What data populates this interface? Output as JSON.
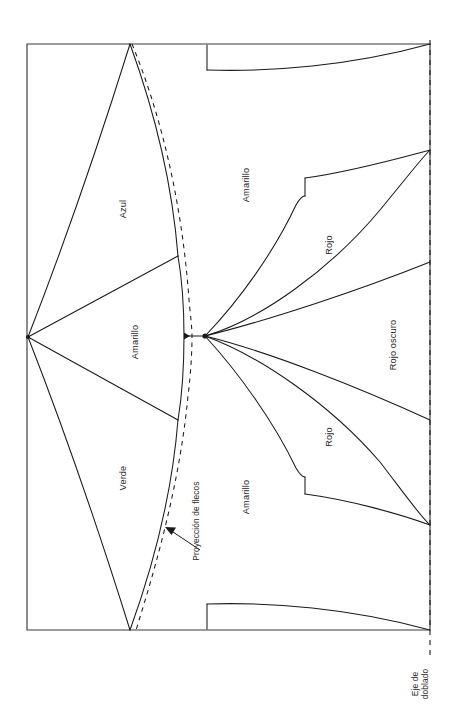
{
  "figure": {
    "stroke_color": "#1a1a1a",
    "frame_color": "#3a3a3a",
    "background_color": "#ffffff"
  },
  "labels": {
    "azul": "Azul",
    "amarillo_izq": "Amarillo",
    "verde": "Verde",
    "proyeccion": "Proyección de flecos",
    "amarillo_sup": "Amarillo",
    "rojo_sup": "Rojo",
    "rojo_oscuro": "Rojo oscuro",
    "rojo_inf": "Rojo",
    "amarillo_inf": "Amarillo",
    "eje_linea1": "Eje de",
    "eje_linea2": "doblado"
  },
  "geometry": {
    "frame": {
      "x": 27,
      "y": 44,
      "width": 403,
      "height": 586
    },
    "left_hub": {
      "x": 28,
      "y": 337
    },
    "center_hub": {
      "x": 205,
      "y": 336
    },
    "fold_axis_x": 430,
    "fold_top_node_y": 150,
    "fold_bottom_node_y": 525,
    "top_apex": {
      "x": 130,
      "y": 44
    },
    "bottom_apex": {
      "x": 130,
      "y": 630
    },
    "notch_top_x": 207,
    "notch_bottom_x": 207
  }
}
